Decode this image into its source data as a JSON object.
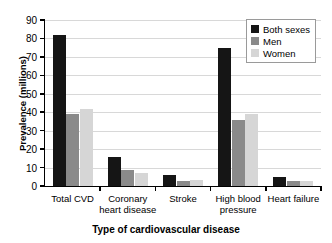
{
  "chart_data": {
    "type": "bar",
    "title": "",
    "xlabel": "Type of cardiovascular disease",
    "ylabel": "Prevalence (millions)",
    "categories": [
      "Total CVD",
      "Coronary heart disease",
      "Stroke",
      "High blood pressure",
      "Heart failure"
    ],
    "category_lines": [
      [
        "Total CVD"
      ],
      [
        "Coronary",
        "heart disease"
      ],
      [
        "Stroke"
      ],
      [
        "High blood",
        "pressure"
      ],
      [
        "Heart failure"
      ]
    ],
    "series": [
      {
        "name": "Both sexes",
        "color": "#151515",
        "values": [
          82,
          16,
          6,
          75,
          5
        ]
      },
      {
        "name": "Men",
        "color": "#8a8a8a",
        "values": [
          39,
          8.5,
          2.5,
          36,
          2.5
        ]
      },
      {
        "name": "Women",
        "color": "#d6d6d6",
        "values": [
          42,
          7,
          3.5,
          39,
          2.5
        ]
      }
    ],
    "ylim": [
      0,
      90
    ],
    "yticks": [
      0,
      10,
      20,
      30,
      40,
      50,
      60,
      70,
      80,
      90
    ],
    "ytick_labels": [
      "0",
      "10",
      "20",
      "30",
      "40",
      "50",
      "60",
      "70",
      "80",
      "90"
    ],
    "grid": true,
    "legend_position": "top-right"
  },
  "legend": {
    "entries": [
      {
        "label": "Both sexes"
      },
      {
        "label": "Men"
      },
      {
        "label": "Women"
      }
    ]
  }
}
